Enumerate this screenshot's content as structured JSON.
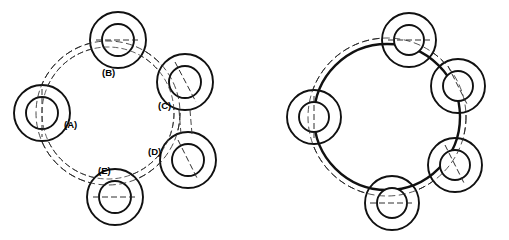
{
  "figure": {
    "background_color": "#ffffff",
    "line_color": "#111111",
    "centerline_color": "#2f2f2f",
    "canvas": {
      "width": 509,
      "height": 240
    }
  },
  "views": [
    {
      "id": "left-view",
      "name": "labelled-view",
      "center": {
        "x": 108,
        "y": 113
      },
      "pitch_circle_radius": 72,
      "pitch_circle_style": "dashed",
      "inner_guide_radius": 66,
      "hub_outer_radius": 28,
      "hub_inner_radius": 16,
      "hub_count": 5,
      "hubs": [
        {
          "key": "A",
          "label": "(A)",
          "angle_deg": 180,
          "cx": 42,
          "cy": 113,
          "label_x": 64,
          "label_y": 125
        },
        {
          "key": "B",
          "label": "(B)",
          "angle_deg": 252,
          "cx": 118,
          "cy": 40,
          "label_x": 102,
          "label_y": 73
        },
        {
          "key": "C",
          "label": "(C)",
          "angle_deg": 324,
          "cx": 185,
          "cy": 82,
          "label_x": 158,
          "label_y": 106
        },
        {
          "key": "D",
          "label": "(D)",
          "angle_deg": 36,
          "cx": 188,
          "cy": 160,
          "label_x": 148,
          "label_y": 152
        },
        {
          "key": "E",
          "label": "(E)",
          "angle_deg": 108,
          "cx": 115,
          "cy": 197,
          "label_x": 98,
          "label_y": 171
        }
      ]
    },
    {
      "id": "right-view",
      "name": "unlabelled-view",
      "center": {
        "x": 387,
        "y": 117
      },
      "ring_radius": 73,
      "ring_style": "solid",
      "pitch_circle_radius": 79,
      "pitch_circle_style": "dashed",
      "hub_outer_radius": 27,
      "hub_inner_radius": 15,
      "hub_count": 5,
      "hubs": [
        {
          "key": "A",
          "label": "",
          "angle_deg": 180,
          "cx": 314,
          "cy": 117
        },
        {
          "key": "B",
          "label": "",
          "angle_deg": 252,
          "cx": 409,
          "cy": 40
        },
        {
          "key": "C",
          "label": "",
          "angle_deg": 324,
          "cx": 458,
          "cy": 86
        },
        {
          "key": "D",
          "label": "",
          "angle_deg": 36,
          "cx": 455,
          "cy": 165
        },
        {
          "key": "E",
          "label": "",
          "angle_deg": 108,
          "cx": 392,
          "cy": 203
        }
      ]
    }
  ],
  "callouts": {
    "items": [
      "(A)",
      "(B)",
      "(C)",
      "(D)",
      "(E)"
    ],
    "font_size_px": 9.5,
    "weight": "bold",
    "color": "#000000"
  }
}
